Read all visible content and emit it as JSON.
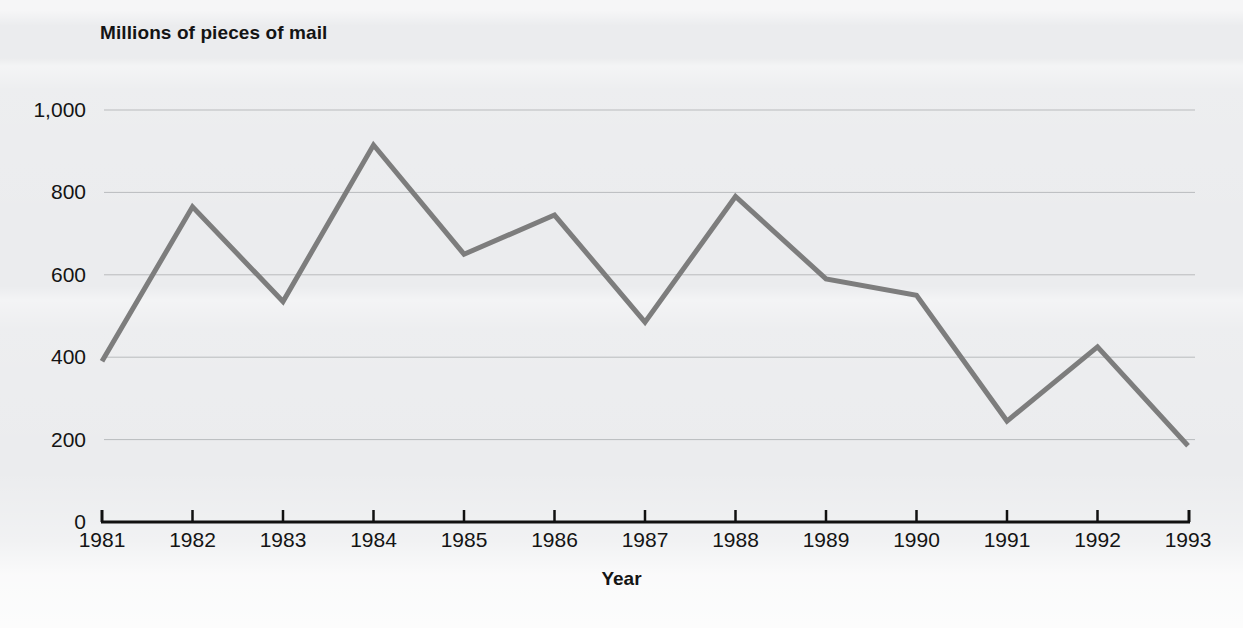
{
  "figure": {
    "background_color": "#ebecee",
    "axis_color": "#111111",
    "grid_color": "#b9bbbd",
    "series_color": "#7d7d7d"
  },
  "chart_data": {
    "type": "line",
    "title": "Millions of pieces of mail",
    "xlabel": "Year",
    "ylabel": "",
    "categories": [
      "1981",
      "1982",
      "1983",
      "1984",
      "1985",
      "1986",
      "1987",
      "1988",
      "1989",
      "1990",
      "1991",
      "1992",
      "1993"
    ],
    "x": [
      1981,
      1982,
      1983,
      1984,
      1985,
      1986,
      1987,
      1988,
      1989,
      1990,
      1991,
      1992,
      1993
    ],
    "values": [
      390,
      765,
      535,
      915,
      650,
      745,
      485,
      790,
      590,
      550,
      245,
      425,
      185
    ],
    "series": [
      {
        "name": "Millions of pieces of mail",
        "values": [
          390,
          765,
          535,
          915,
          650,
          745,
          485,
          790,
          590,
          550,
          245,
          425,
          185
        ]
      }
    ],
    "ylim": [
      0,
      1000
    ],
    "yticks": [
      0,
      200,
      400,
      600,
      800,
      1000
    ],
    "ytick_labels": [
      "0",
      "200",
      "400",
      "600",
      "800",
      "1,000"
    ],
    "xtick_labels": [
      "1981",
      "1982",
      "1983",
      "1984",
      "1985",
      "1986",
      "1987",
      "1988",
      "1989",
      "1990",
      "1991",
      "1992",
      "1993"
    ],
    "grid": "horizontal",
    "legend": "none",
    "line_color": "#7d7d7d",
    "line_width": 5
  }
}
